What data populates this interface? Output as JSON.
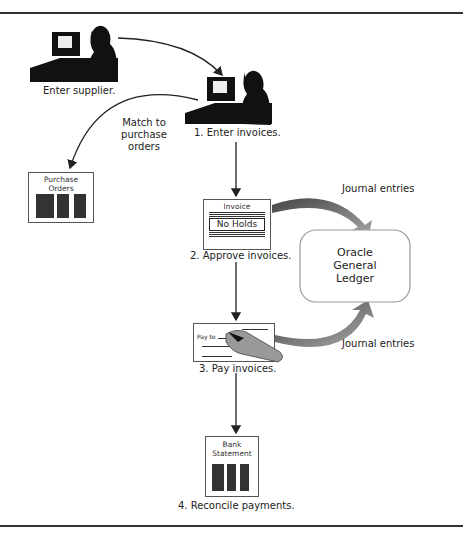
{
  "diagram": {
    "steps": {
      "enter_supplier": "Enter supplier.",
      "enter_invoices": "1. Enter invoices.",
      "approve_invoices": "2. Approve invoices.",
      "pay_invoices": "3. Pay invoices.",
      "reconcile": "4. Reconcile payments."
    },
    "match_label_lines": [
      "Match to",
      "purchase",
      "orders"
    ],
    "purchase_orders_lines": [
      "Purchase",
      "Orders"
    ],
    "invoice": {
      "title": "Invoice",
      "badge": "No Holds"
    },
    "check": {
      "pay_to": "Pay to"
    },
    "bank_statement_lines": [
      "Bank",
      "Statement"
    ],
    "ledger_lines": [
      "Oracle",
      "General",
      "Ledger"
    ],
    "journal_entries_top": "Journal entries",
    "journal_entries_bottom": "Journal entries"
  }
}
